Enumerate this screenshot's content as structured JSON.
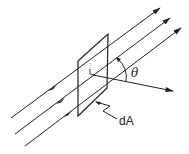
{
  "diagram": {
    "title": "",
    "labels": {
      "angle": "θ",
      "area": "dA"
    },
    "elements": {
      "flux_lines": 3,
      "surface": "tilted square surface element",
      "normal": "normal vector at angle θ to the flux lines"
    },
    "colors": {
      "stroke": "#222222",
      "background": "#ffffff"
    }
  }
}
